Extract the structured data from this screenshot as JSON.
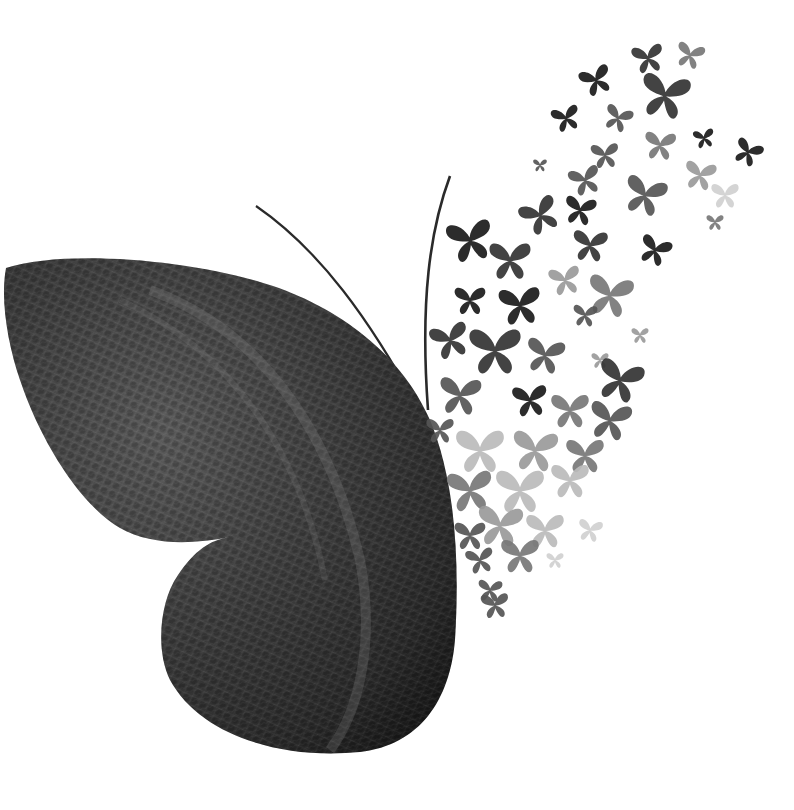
{
  "image": {
    "description": "Grayscale artwork: a half butterfly whose left wing is textured leather; the right side dissolves into a swarm of small watercolor butterflies flying up and to the right.",
    "background_color": "#ffffff",
    "wing": {
      "texture": "leather",
      "colors": {
        "dark": "#1e1e1e",
        "mid": "#4a4a4a",
        "light": "#7a7a7a"
      }
    },
    "antennae": {
      "count": 2,
      "color": "#2a2a2a"
    },
    "swarm": {
      "style": "watercolor",
      "tones": [
        "#1a1a1a",
        "#333333",
        "#555555",
        "#777777",
        "#9a9a9a",
        "#bbbbbb",
        "#d0d0d0"
      ],
      "butterflies": [
        {
          "x": 648,
          "y": 58,
          "s": 0.9,
          "r": -10,
          "t": 1
        },
        {
          "x": 690,
          "y": 55,
          "s": 0.8,
          "r": 15,
          "t": 3
        },
        {
          "x": 596,
          "y": 80,
          "s": 0.9,
          "r": -20,
          "t": 0
        },
        {
          "x": 665,
          "y": 95,
          "s": 1.4,
          "r": 10,
          "t": 1
        },
        {
          "x": 566,
          "y": 118,
          "s": 0.8,
          "r": -15,
          "t": 0
        },
        {
          "x": 618,
          "y": 118,
          "s": 0.8,
          "r": 20,
          "t": 2
        },
        {
          "x": 660,
          "y": 145,
          "s": 0.9,
          "r": 5,
          "t": 3
        },
        {
          "x": 704,
          "y": 138,
          "s": 0.6,
          "r": -10,
          "t": 0
        },
        {
          "x": 748,
          "y": 152,
          "s": 0.8,
          "r": 25,
          "t": 0
        },
        {
          "x": 540,
          "y": 165,
          "s": 0.4,
          "r": 0,
          "t": 2
        },
        {
          "x": 605,
          "y": 155,
          "s": 0.8,
          "r": -5,
          "t": 2
        },
        {
          "x": 700,
          "y": 175,
          "s": 0.9,
          "r": 10,
          "t": 4
        },
        {
          "x": 725,
          "y": 195,
          "s": 0.8,
          "r": 0,
          "t": 6
        },
        {
          "x": 715,
          "y": 222,
          "s": 0.5,
          "r": 0,
          "t": 3
        },
        {
          "x": 585,
          "y": 180,
          "s": 0.9,
          "r": -15,
          "t": 2
        },
        {
          "x": 645,
          "y": 195,
          "s": 1.2,
          "r": 15,
          "t": 2
        },
        {
          "x": 540,
          "y": 215,
          "s": 1.1,
          "r": -25,
          "t": 1
        },
        {
          "x": 580,
          "y": 210,
          "s": 0.9,
          "r": 10,
          "t": 0
        },
        {
          "x": 470,
          "y": 240,
          "s": 1.3,
          "r": -10,
          "t": 0
        },
        {
          "x": 590,
          "y": 245,
          "s": 1.0,
          "r": 5,
          "t": 1
        },
        {
          "x": 655,
          "y": 250,
          "s": 0.9,
          "r": 20,
          "t": 0
        },
        {
          "x": 510,
          "y": 260,
          "s": 1.2,
          "r": 0,
          "t": 1
        },
        {
          "x": 565,
          "y": 280,
          "s": 0.9,
          "r": -10,
          "t": 4
        },
        {
          "x": 610,
          "y": 295,
          "s": 1.3,
          "r": 10,
          "t": 3
        },
        {
          "x": 470,
          "y": 300,
          "s": 0.9,
          "r": 0,
          "t": 0
        },
        {
          "x": 520,
          "y": 305,
          "s": 1.2,
          "r": -5,
          "t": 0
        },
        {
          "x": 585,
          "y": 315,
          "s": 0.7,
          "r": 5,
          "t": 2
        },
        {
          "x": 640,
          "y": 335,
          "s": 0.5,
          "r": 0,
          "t": 4
        },
        {
          "x": 450,
          "y": 340,
          "s": 1.1,
          "r": -15,
          "t": 1
        },
        {
          "x": 495,
          "y": 350,
          "s": 1.5,
          "r": 0,
          "t": 1
        },
        {
          "x": 545,
          "y": 355,
          "s": 1.1,
          "r": 10,
          "t": 2
        },
        {
          "x": 600,
          "y": 360,
          "s": 0.5,
          "r": 0,
          "t": 4
        },
        {
          "x": 620,
          "y": 380,
          "s": 1.3,
          "r": 15,
          "t": 1
        },
        {
          "x": 460,
          "y": 395,
          "s": 1.2,
          "r": 5,
          "t": 2
        },
        {
          "x": 530,
          "y": 400,
          "s": 1.0,
          "r": -5,
          "t": 0
        },
        {
          "x": 570,
          "y": 410,
          "s": 1.1,
          "r": 0,
          "t": 3
        },
        {
          "x": 610,
          "y": 420,
          "s": 1.2,
          "r": 10,
          "t": 2
        },
        {
          "x": 440,
          "y": 430,
          "s": 0.8,
          "r": 0,
          "t": 2
        },
        {
          "x": 480,
          "y": 450,
          "s": 1.4,
          "r": 0,
          "t": 5
        },
        {
          "x": 535,
          "y": 450,
          "s": 1.3,
          "r": 5,
          "t": 4
        },
        {
          "x": 585,
          "y": 455,
          "s": 1.1,
          "r": 0,
          "t": 3
        },
        {
          "x": 470,
          "y": 490,
          "s": 1.3,
          "r": -5,
          "t": 3
        },
        {
          "x": 520,
          "y": 490,
          "s": 1.4,
          "r": 0,
          "t": 5
        },
        {
          "x": 570,
          "y": 480,
          "s": 1.1,
          "r": 0,
          "t": 5
        },
        {
          "x": 500,
          "y": 525,
          "s": 1.3,
          "r": 5,
          "t": 4
        },
        {
          "x": 545,
          "y": 530,
          "s": 1.1,
          "r": 0,
          "t": 5
        },
        {
          "x": 590,
          "y": 530,
          "s": 0.7,
          "r": 10,
          "t": 6
        },
        {
          "x": 470,
          "y": 535,
          "s": 0.9,
          "r": 0,
          "t": 2
        },
        {
          "x": 480,
          "y": 560,
          "s": 0.8,
          "r": -10,
          "t": 2
        },
        {
          "x": 520,
          "y": 555,
          "s": 1.1,
          "r": 0,
          "t": 3
        },
        {
          "x": 555,
          "y": 560,
          "s": 0.5,
          "r": 0,
          "t": 6
        },
        {
          "x": 490,
          "y": 590,
          "s": 0.7,
          "r": 5,
          "t": 2
        },
        {
          "x": 495,
          "y": 605,
          "s": 0.8,
          "r": -5,
          "t": 2
        }
      ]
    }
  }
}
